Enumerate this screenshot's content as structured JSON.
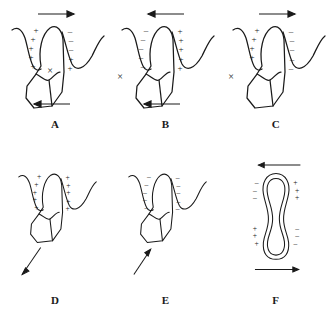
{
  "figure": {
    "title": "",
    "stroke_color": "#1a1a1a",
    "background_color": "#ffffff",
    "charge_positive": "+",
    "charge_negative": "–",
    "resorption_mark": "×"
  },
  "panels": [
    {
      "id": "A",
      "label": "A",
      "shape": "tooth-in-socket",
      "top_arrow": {
        "present": true,
        "direction": "right",
        "label": "arrow-right"
      },
      "bottom_arrow": {
        "present": true,
        "direction": "left",
        "label": "arrow-left"
      },
      "diagonal_arrow": {
        "present": false,
        "direction": ""
      },
      "left_charges": [
        "+",
        "+",
        "+",
        "+",
        "+"
      ],
      "right_charges_upper": [
        "–",
        "–",
        "–"
      ],
      "right_charges_lower": [
        "+",
        "+"
      ],
      "mark": {
        "symbol": "×",
        "position": "inside-crown-center"
      }
    },
    {
      "id": "B",
      "label": "B",
      "shape": "tooth-in-socket",
      "top_arrow": {
        "present": true,
        "direction": "left",
        "label": "arrow-left"
      },
      "bottom_arrow": {
        "present": true,
        "direction": "left",
        "label": "arrow-left"
      },
      "diagonal_arrow": {
        "present": false,
        "direction": ""
      },
      "left_charges": [
        "–",
        "–",
        "–",
        "–",
        "–"
      ],
      "right_charges_upper": [
        "+",
        "+",
        "+"
      ],
      "right_charges_lower": [
        "+",
        "+"
      ],
      "mark": {
        "symbol": "×",
        "position": "outside-left"
      }
    },
    {
      "id": "C",
      "label": "C",
      "shape": "tooth-in-socket",
      "top_arrow": {
        "present": true,
        "direction": "right",
        "label": "arrow-right"
      },
      "bottom_arrow": {
        "present": false,
        "direction": ""
      },
      "diagonal_arrow": {
        "present": false,
        "direction": ""
      },
      "left_charges": [
        "+",
        "+",
        "+",
        "+"
      ],
      "right_charges_upper": [
        "–",
        "–",
        "–"
      ],
      "right_charges_lower": [
        "–",
        "–"
      ],
      "mark": {
        "symbol": "×",
        "position": "outside-left"
      }
    },
    {
      "id": "D",
      "label": "D",
      "shape": "tooth-in-socket",
      "top_arrow": {
        "present": false,
        "direction": ""
      },
      "bottom_arrow": {
        "present": false,
        "direction": ""
      },
      "diagonal_arrow": {
        "present": true,
        "direction": "down-left",
        "label": "arrow-down-left"
      },
      "left_charges": [
        "+",
        "+",
        "+",
        "+",
        "+"
      ],
      "right_charges_upper": [
        "+",
        "+",
        "+"
      ],
      "right_charges_lower": [
        "+",
        "+"
      ],
      "mark": {
        "symbol": "",
        "position": ""
      }
    },
    {
      "id": "E",
      "label": "E",
      "shape": "tooth-in-socket",
      "top_arrow": {
        "present": false,
        "direction": ""
      },
      "bottom_arrow": {
        "present": false,
        "direction": ""
      },
      "diagonal_arrow": {
        "present": true,
        "direction": "up-right",
        "label": "arrow-up-right"
      },
      "left_charges": [
        "–",
        "–",
        "–",
        "–",
        "–"
      ],
      "right_charges_upper": [
        "–",
        "–",
        "–"
      ],
      "right_charges_lower": [
        "–",
        "–"
      ],
      "mark": {
        "symbol": "",
        "position": ""
      }
    },
    {
      "id": "F",
      "label": "F",
      "shape": "elongated-oval-root-section",
      "top_arrow": {
        "present": true,
        "direction": "left",
        "label": "arrow-left"
      },
      "bottom_arrow": {
        "present": true,
        "direction": "right",
        "label": "arrow-right"
      },
      "diagonal_arrow": {
        "present": false,
        "direction": ""
      },
      "quadrant_charges": {
        "top_left": [
          "–",
          "–",
          "–"
        ],
        "top_right": [
          "+",
          "+",
          "+"
        ],
        "bottom_left": [
          "+",
          "+",
          "+"
        ],
        "bottom_right": [
          "–",
          "–",
          "–"
        ]
      },
      "mark": {
        "symbol": "",
        "position": ""
      }
    }
  ]
}
